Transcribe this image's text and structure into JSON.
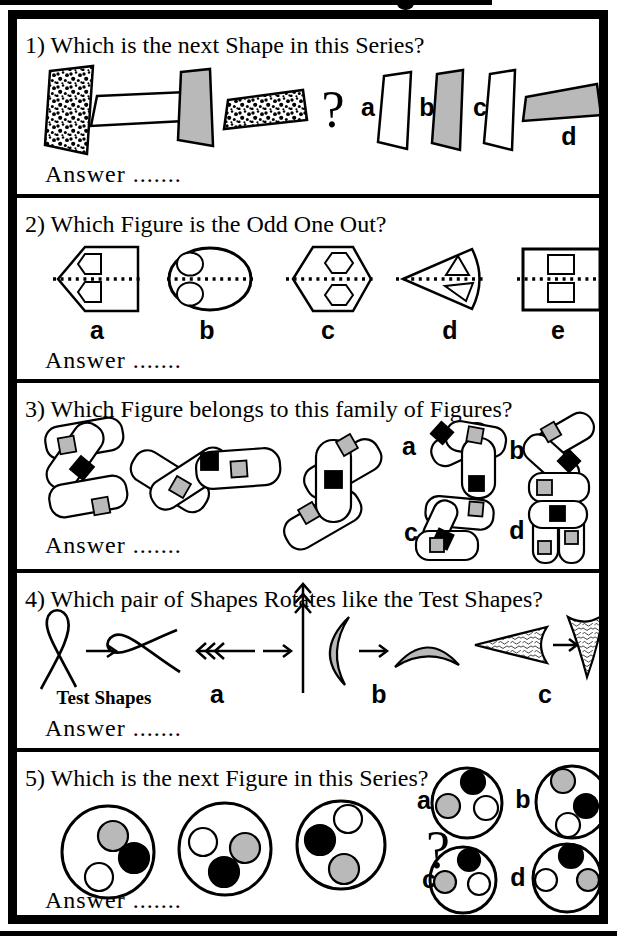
{
  "page": {
    "background": "#ffffff",
    "ink": "#000000",
    "gray_fill": "#b9b9b9"
  },
  "questions": [
    {
      "title": "1) Which is the next Shape in this Series?",
      "answer_label": "Answer .......",
      "question_mark": "?",
      "options": [
        "a",
        "b",
        "c",
        "d"
      ]
    },
    {
      "title": "2) Which Figure is the Odd One Out?",
      "answer_label": "Answer .......",
      "options": [
        "a",
        "b",
        "c",
        "d",
        "e"
      ]
    },
    {
      "title": "3) Which Figure belongs to this family of Figures?",
      "answer_label": "Answer .......",
      "options": [
        "a",
        "b",
        "c",
        "d"
      ]
    },
    {
      "title": "4) Which pair of Shapes Rotates like the Test Shapes?",
      "answer_label": "Answer .......",
      "test_shapes_label": "Test Shapes",
      "options": [
        "a",
        "b",
        "c"
      ]
    },
    {
      "title": "5) Which is the next Figure in this Series?",
      "answer_label": "Answer .......",
      "question_mark": "?",
      "options": [
        "a",
        "b",
        "c",
        "d"
      ]
    }
  ]
}
